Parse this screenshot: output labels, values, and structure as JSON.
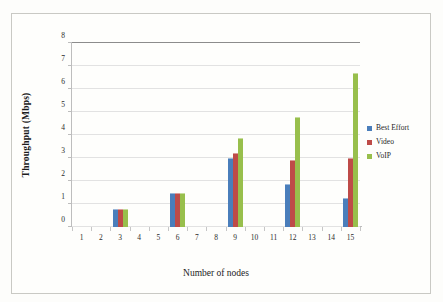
{
  "chart_data": {
    "type": "bar",
    "title": "",
    "xlabel": "Number of nodes",
    "ylabel": "Throughput (Mbps)",
    "ylim": [
      0,
      8
    ],
    "ytick_labels": [
      "0",
      "1",
      "2",
      "3",
      "4",
      "5",
      "6",
      "7",
      "8"
    ],
    "xtick_labels": [
      "1",
      "2",
      "3",
      "4",
      "5",
      "6",
      "7",
      "8",
      "9",
      "10",
      "11",
      "12",
      "13",
      "14",
      "15"
    ],
    "categories": [
      "3",
      "6",
      "9",
      "12",
      "15"
    ],
    "grid": true,
    "legend_position": "right",
    "series": [
      {
        "name": "Best Effort",
        "color": "#4a7ebb",
        "values": [
          0.8,
          1.5,
          3.0,
          1.85,
          1.25
        ]
      },
      {
        "name": "Video",
        "color": "#be4b48",
        "values": [
          0.8,
          1.5,
          3.2,
          2.9,
          3.0
        ]
      },
      {
        "name": "VoIP",
        "color": "#98bf4c",
        "values": [
          0.8,
          1.5,
          3.85,
          4.8,
          6.7
        ]
      }
    ]
  },
  "legend": {
    "items": [
      {
        "label": "Best Effort"
      },
      {
        "label": "Video"
      },
      {
        "label": "VoIP"
      }
    ]
  }
}
